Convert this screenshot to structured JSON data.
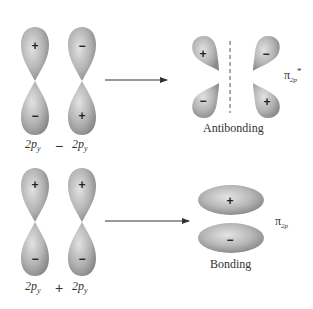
{
  "top": {
    "left_orbital": {
      "label": "2p",
      "sub": "y",
      "upper_sign": "+",
      "lower_sign": "−"
    },
    "operator": "−",
    "right_orbital": {
      "label": "2p",
      "sub": "y",
      "upper_sign": "−",
      "lower_sign": "+"
    },
    "result": {
      "lobes": {
        "top_left": "+",
        "top_right": "−",
        "bottom_left": "−",
        "bottom_right": "+"
      },
      "symbol": "π",
      "symbol_sub": "2p",
      "symbol_sup": "*",
      "caption": "Antibonding"
    }
  },
  "bottom": {
    "left_orbital": {
      "label": "2p",
      "sub": "y",
      "upper_sign": "+",
      "lower_sign": "−"
    },
    "operator": "+",
    "right_orbital": {
      "label": "2p",
      "sub": "y",
      "upper_sign": "+",
      "lower_sign": "−"
    },
    "result": {
      "lobes": {
        "top": "+",
        "bottom": "−"
      },
      "symbol": "π",
      "symbol_sub": "2p",
      "caption": "Bonding"
    }
  },
  "colors": {
    "lobe_light": "#dcdcdc",
    "lobe_dark": "#8e8e8e",
    "arrow": "#333333"
  }
}
